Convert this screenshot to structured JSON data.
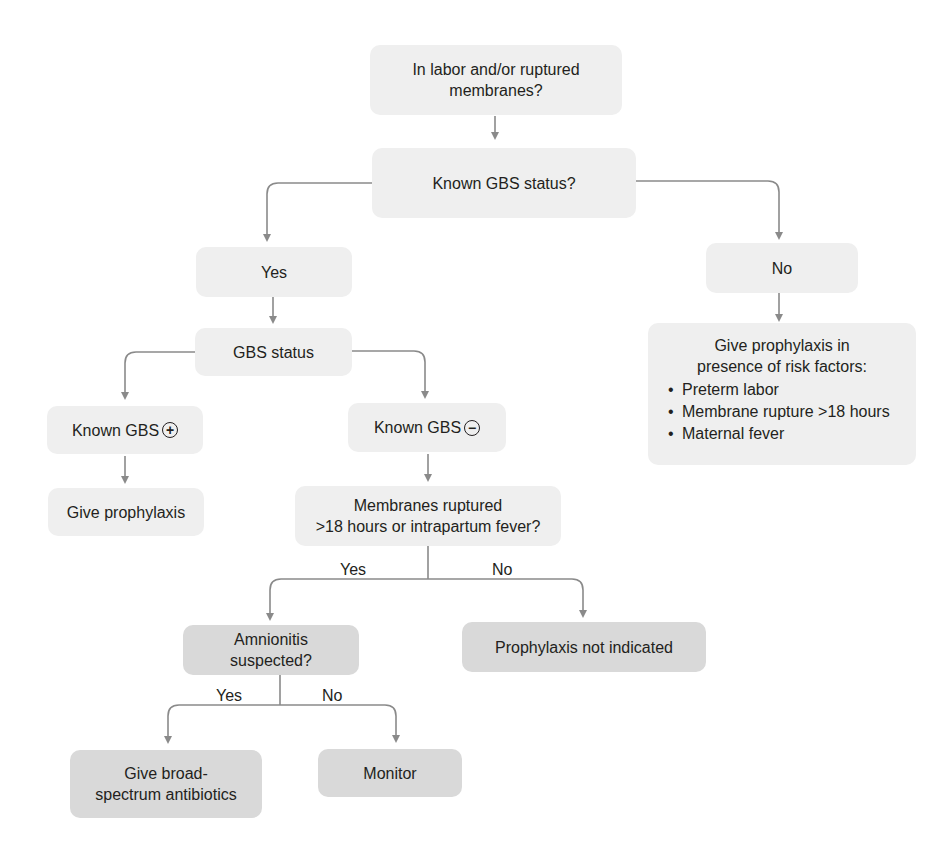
{
  "diagram": {
    "colors": {
      "box_light": "#efefef",
      "box_dark": "#d9d9d9",
      "line": "#8a8a8a",
      "text": "#231f20"
    },
    "nodes": {
      "root": "In labor and/or ruptured membranes?",
      "known_status": "Known GBS status?",
      "yes": "Yes",
      "no": "No",
      "gbs_status": "GBS status",
      "known_pos": "Known GBS",
      "known_pos_symbol": "+",
      "known_neg": "Known GBS",
      "known_neg_symbol": "−",
      "give_prophylaxis": "Give prophylaxis",
      "membranes_line1": "Membranes ruptured",
      "membranes_line2": ">18 hours or intrapartum fever?",
      "amnionitis": "Amnionitis suspected?",
      "not_indicated": "Prophylaxis not indicated",
      "broad_line1": "Give broad-",
      "broad_line2": "spectrum antibiotics",
      "monitor": "Monitor",
      "risk_title_line1": "Give prophylaxis in",
      "risk_title_line2": "presence of risk factors:",
      "risk_factors": [
        "Preterm labor",
        "Membrane rupture >18 hours",
        "Maternal fever"
      ]
    },
    "edge_labels": {
      "membranes_yes": "Yes",
      "membranes_no": "No",
      "amnionitis_yes": "Yes",
      "amnionitis_no": "No"
    }
  }
}
